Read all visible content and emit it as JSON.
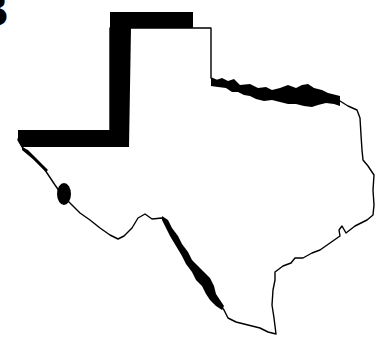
{
  "figure": {
    "panel_label": "B",
    "colors": {
      "background": "#ffffff",
      "outline": "#000000",
      "state_fill": "#ffffff",
      "highlighted_border": "#000000"
    },
    "highlighted_borders": [
      {
        "name": "panhandle-west-and-north-border",
        "style": "thick-black-band"
      },
      {
        "name": "red-river-border",
        "style": "thick-black-band"
      },
      {
        "name": "rio-grande-upper-segment",
        "style": "black-band"
      },
      {
        "name": "rio-grande-lower-segment",
        "style": "black-band"
      }
    ]
  }
}
